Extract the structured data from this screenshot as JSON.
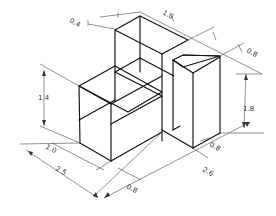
{
  "drawing": {
    "title": "Isometric view of stepped block with dimensions",
    "colors": {
      "edge": "#111111",
      "dimension_line": "#4a4a4a",
      "dimension_text": "#333333",
      "background": "#ffffff"
    },
    "dimensions": {
      "top_offset": "0.4",
      "top_width": "1.0",
      "right_depth_top": "0.8",
      "left_height": "1.4",
      "right_height": "1.8",
      "right_inner_depth": "0.8",
      "front_depth_small": "1.0",
      "front_total": "2.5",
      "front_bottom_offset": "0.8",
      "right_total": "2.6"
    }
  }
}
